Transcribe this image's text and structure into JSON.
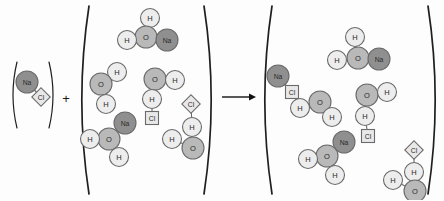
{
  "figure": {
    "kind": "chemical-reaction-diagram",
    "operators": {
      "plus": "+",
      "arrow": "→"
    }
  },
  "legend": {
    "species": [
      {
        "symbol": "Na",
        "name": "sodium",
        "shape": "circle",
        "color": "#8f8f8f",
        "radius": 11
      },
      {
        "symbol": "Cl",
        "name": "chlorine",
        "shape": "square",
        "color": "#e8e8e8",
        "size": 13
      },
      {
        "symbol": "O",
        "name": "oxygen",
        "shape": "circle",
        "color": "#b9b9b9",
        "radius": 11
      },
      {
        "symbol": "H",
        "name": "hydrogen",
        "shape": "circle",
        "color": "#ededed",
        "radius": 9.5
      }
    ],
    "stroke": "#6a6a6a"
  },
  "panels": [
    {
      "id": "reactant-salt",
      "name": "sodium-chloride-container",
      "bracket": {
        "left_x": 12,
        "right_x": 54,
        "top_y": 62,
        "bottom_y": 128,
        "bow": 5
      },
      "particles": [
        {
          "type": "Na",
          "x": 27,
          "y": 82,
          "r": 11
        },
        {
          "type": "Cl",
          "x": 41,
          "y": 97,
          "s": 13,
          "rot": 45
        }
      ],
      "bonds": [
        {
          "from": [
            27,
            82
          ],
          "to": [
            41,
            97
          ]
        }
      ]
    },
    {
      "id": "reactant-water",
      "name": "water-container",
      "bracket": {
        "left_x": 80,
        "right_x": 213,
        "top_y": 6,
        "bottom_y": 194,
        "bow": 9
      },
      "particles": [
        {
          "type": "H",
          "x": 150,
          "y": 18,
          "r": 9.5
        },
        {
          "type": "O",
          "x": 146,
          "y": 37,
          "r": 11
        },
        {
          "type": "H",
          "x": 127,
          "y": 40,
          "r": 9.5
        },
        {
          "type": "Na",
          "x": 167,
          "y": 40,
          "r": 11
        },
        {
          "type": "H",
          "x": 117,
          "y": 72,
          "r": 9.5
        },
        {
          "type": "O",
          "x": 101,
          "y": 84,
          "r": 11
        },
        {
          "type": "H",
          "x": 106,
          "y": 104,
          "r": 9.5
        },
        {
          "type": "O",
          "x": 155,
          "y": 79,
          "r": 11
        },
        {
          "type": "H",
          "x": 175,
          "y": 80,
          "r": 9.5
        },
        {
          "type": "H",
          "x": 152,
          "y": 99,
          "r": 9.5
        },
        {
          "type": "Cl",
          "x": 152,
          "y": 118,
          "s": 13,
          "rot": 0
        },
        {
          "type": "Na",
          "x": 125,
          "y": 123,
          "r": 11
        },
        {
          "type": "O",
          "x": 109,
          "y": 139,
          "r": 11
        },
        {
          "type": "H",
          "x": 90,
          "y": 139,
          "r": 9.5
        },
        {
          "type": "H",
          "x": 119,
          "y": 157,
          "r": 9.5
        },
        {
          "type": "Cl",
          "x": 191,
          "y": 104,
          "s": 13,
          "rot": 45
        },
        {
          "type": "H",
          "x": 192,
          "y": 127,
          "r": 9.5
        },
        {
          "type": "O",
          "x": 193,
          "y": 148,
          "r": 11
        },
        {
          "type": "H",
          "x": 172,
          "y": 139,
          "r": 9.5
        }
      ],
      "bonds": [
        {
          "from": [
            150,
            18
          ],
          "to": [
            146,
            37
          ]
        },
        {
          "from": [
            127,
            40
          ],
          "to": [
            146,
            37
          ]
        },
        {
          "from": [
            146,
            37
          ],
          "to": [
            167,
            40
          ]
        },
        {
          "from": [
            117,
            72
          ],
          "to": [
            101,
            84
          ]
        },
        {
          "from": [
            101,
            84
          ],
          "to": [
            106,
            104
          ]
        },
        {
          "from": [
            155,
            79
          ],
          "to": [
            175,
            80
          ]
        },
        {
          "from": [
            155,
            79
          ],
          "to": [
            152,
            99
          ]
        },
        {
          "from": [
            152,
            99
          ],
          "to": [
            152,
            118
          ]
        },
        {
          "from": [
            125,
            123
          ],
          "to": [
            109,
            139
          ]
        },
        {
          "from": [
            109,
            139
          ],
          "to": [
            90,
            139
          ]
        },
        {
          "from": [
            109,
            139
          ],
          "to": [
            119,
            157
          ]
        },
        {
          "from": [
            191,
            104
          ],
          "to": [
            192,
            127
          ]
        },
        {
          "from": [
            192,
            127
          ],
          "to": [
            193,
            148
          ]
        },
        {
          "from": [
            193,
            148
          ],
          "to": [
            172,
            139
          ]
        }
      ]
    },
    {
      "id": "product-solution",
      "name": "salt-solution-container",
      "bracket": {
        "left_x": 263,
        "right_x": 437,
        "top_y": 6,
        "bottom_y": 194,
        "bow": 9
      },
      "particles": [
        {
          "type": "H",
          "x": 355,
          "y": 37,
          "r": 9.5
        },
        {
          "type": "O",
          "x": 358,
          "y": 58,
          "r": 11
        },
        {
          "type": "H",
          "x": 337,
          "y": 60,
          "r": 9.5
        },
        {
          "type": "Na",
          "x": 379,
          "y": 59,
          "r": 11
        },
        {
          "type": "Na",
          "x": 278,
          "y": 76,
          "r": 11
        },
        {
          "type": "Cl",
          "x": 292,
          "y": 92,
          "s": 13,
          "rot": 0
        },
        {
          "type": "H",
          "x": 300,
          "y": 108,
          "r": 9.5
        },
        {
          "type": "O",
          "x": 320,
          "y": 102,
          "r": 11
        },
        {
          "type": "H",
          "x": 332,
          "y": 117,
          "r": 9.5
        },
        {
          "type": "O",
          "x": 367,
          "y": 95,
          "r": 11
        },
        {
          "type": "H",
          "x": 387,
          "y": 92,
          "r": 9.5
        },
        {
          "type": "H",
          "x": 365,
          "y": 116,
          "r": 9.5
        },
        {
          "type": "Cl",
          "x": 368,
          "y": 136,
          "s": 13,
          "rot": 0
        },
        {
          "type": "Na",
          "x": 344,
          "y": 142,
          "r": 11
        },
        {
          "type": "O",
          "x": 327,
          "y": 156,
          "r": 11
        },
        {
          "type": "H",
          "x": 308,
          "y": 159,
          "r": 9.5
        },
        {
          "type": "H",
          "x": 335,
          "y": 175,
          "r": 9.5
        },
        {
          "type": "Cl",
          "x": 414,
          "y": 150,
          "s": 13,
          "rot": 45
        },
        {
          "type": "H",
          "x": 414,
          "y": 172,
          "r": 9.5
        },
        {
          "type": "O",
          "x": 415,
          "y": 191,
          "r": 11
        },
        {
          "type": "H",
          "x": 393,
          "y": 180,
          "r": 9.5
        }
      ],
      "bonds": [
        {
          "from": [
            355,
            37
          ],
          "to": [
            358,
            58
          ]
        },
        {
          "from": [
            337,
            60
          ],
          "to": [
            358,
            58
          ]
        },
        {
          "from": [
            358,
            58
          ],
          "to": [
            379,
            59
          ]
        },
        {
          "from": [
            278,
            76
          ],
          "to": [
            292,
            92
          ]
        },
        {
          "from": [
            292,
            92
          ],
          "to": [
            300,
            108
          ]
        },
        {
          "from": [
            300,
            108
          ],
          "to": [
            320,
            102
          ]
        },
        {
          "from": [
            320,
            102
          ],
          "to": [
            332,
            117
          ]
        },
        {
          "from": [
            367,
            95
          ],
          "to": [
            387,
            92
          ]
        },
        {
          "from": [
            367,
            95
          ],
          "to": [
            365,
            116
          ]
        },
        {
          "from": [
            365,
            116
          ],
          "to": [
            368,
            136
          ]
        },
        {
          "from": [
            344,
            142
          ],
          "to": [
            327,
            156
          ]
        },
        {
          "from": [
            327,
            156
          ],
          "to": [
            308,
            159
          ]
        },
        {
          "from": [
            327,
            156
          ],
          "to": [
            335,
            175
          ]
        },
        {
          "from": [
            414,
            150
          ],
          "to": [
            414,
            172
          ]
        },
        {
          "from": [
            414,
            172
          ],
          "to": [
            415,
            191
          ]
        },
        {
          "from": [
            415,
            191
          ],
          "to": [
            393,
            180
          ]
        }
      ]
    }
  ],
  "operator_marks": [
    {
      "id": "plus",
      "name": "plus-sign",
      "glyph": "+",
      "x": 66,
      "y": 98
    },
    {
      "id": "arrow",
      "name": "reaction-arrow",
      "x1": 222,
      "y1": 97,
      "x2": 256,
      "y2": 97
    }
  ]
}
